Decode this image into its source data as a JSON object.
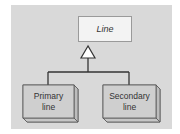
{
  "diagram": {
    "type": "uml-generalization",
    "superclass": {
      "label": "Line",
      "style": "italic"
    },
    "subclasses": [
      {
        "label_line1": "Primary",
        "label_line2": "line"
      },
      {
        "label_line1": "Secondary",
        "label_line2": "line"
      }
    ],
    "colors": {
      "background": "#d9d9d9",
      "superclass_fill": "#f3f3f3",
      "subclass_fill": "#cfcfcf",
      "subclass_side": "#bdbdbd",
      "subclass_bottom": "#c6c6c6",
      "line": "#333333"
    }
  }
}
